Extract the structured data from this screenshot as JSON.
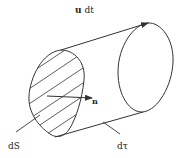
{
  "diagram": {
    "labels": {
      "velocity": "u dt",
      "velocity_bold": "u",
      "velocity_rest": " dt",
      "normal": "n",
      "surface": "dS",
      "volume": "dτ"
    },
    "colors": {
      "stroke": "#333333",
      "background": "#ffffff"
    }
  }
}
